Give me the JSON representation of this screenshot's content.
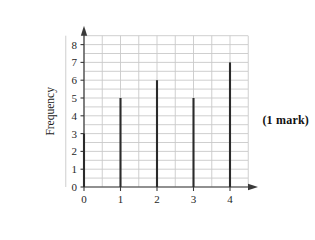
{
  "chart_data": {
    "type": "bar",
    "title": "",
    "subtitle": "",
    "xlabel": "Number of letters",
    "ylabel": "Frequency",
    "categories": [
      "0",
      "1",
      "2",
      "3",
      "4"
    ],
    "values": [
      3,
      5,
      6,
      5,
      7
    ],
    "series": [
      {
        "name": "Frequency",
        "values": [
          3,
          5,
          6,
          5,
          7
        ]
      }
    ],
    "xlim": [
      -0.5,
      4.5
    ],
    "ylim": [
      0,
      8.5
    ],
    "y_ticks": [
      0,
      1,
      2,
      3,
      4,
      5,
      6,
      7,
      8
    ],
    "x_ticks": [
      0,
      1,
      2,
      3,
      4
    ],
    "grid": true,
    "grid_interval": 0.5,
    "legend": "none",
    "bar_style": "thin-vertical-lines",
    "axis_arrows": true,
    "colors": {
      "bar": "#2b2b2b",
      "grid": "#c9c9c9",
      "axis": "#3a3a3a",
      "text": "#1a1a1a",
      "background": "#ffffff"
    }
  },
  "annotations": {
    "mark_note": "(1 mark)"
  },
  "icons": {
    "x_axis_arrow": "arrow-right-icon",
    "y_axis_arrow": "arrow-up-icon"
  }
}
